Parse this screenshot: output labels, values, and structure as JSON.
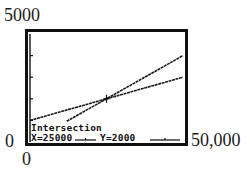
{
  "chart_data": {
    "type": "line",
    "title": "",
    "xlabel": "",
    "ylabel": "",
    "xlim": [
      0,
      50000
    ],
    "ylim": [
      0,
      5000
    ],
    "tick_labels": {
      "x_min": "0",
      "x_max": "50,000",
      "y_min": "0",
      "y_max": "5000"
    },
    "y_ticks": [
      1000,
      2000,
      3000,
      4000
    ],
    "grid": false,
    "series": [
      {
        "name": "Y1",
        "equation": "y = 1000 + 0.04x",
        "x": [
          0,
          50000
        ],
        "y": [
          1000,
          3000
        ]
      },
      {
        "name": "Y2",
        "equation": "y = 0.08x",
        "x": [
          12000,
          50000
        ],
        "y": [
          960,
          4000
        ]
      }
    ],
    "annotations": [
      {
        "type": "intersection",
        "x": 25000,
        "y": 2000
      }
    ]
  },
  "labels": {
    "y_max": "5000",
    "y_min": "0",
    "x_min": "0",
    "x_max": "50,000"
  },
  "screen": {
    "title": "Intersection",
    "x_readout": "X=25000",
    "y_readout": "Y=2000"
  }
}
